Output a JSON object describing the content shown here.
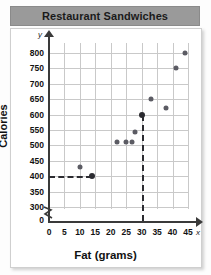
{
  "title": "Restaurant Sandwiches",
  "chart_data": {
    "type": "scatter",
    "title": "Restaurant Sandwiches",
    "xlabel": "Fat (grams)",
    "ylabel": "Calories",
    "xlim": [
      0,
      47
    ],
    "ylim": [
      280,
      820
    ],
    "grid": true,
    "legend": "none",
    "axis_letters": {
      "x": "x",
      "y": "y"
    },
    "y_axis_break": true,
    "xticks": [
      0,
      5,
      10,
      15,
      20,
      25,
      30,
      35,
      40,
      45
    ],
    "yticks": [
      0,
      300,
      350,
      400,
      450,
      500,
      550,
      600,
      650,
      700,
      750,
      800
    ],
    "x": [
      10,
      14,
      22,
      25,
      27,
      28,
      30,
      33,
      38,
      41,
      44
    ],
    "y": [
      430,
      400,
      510,
      510,
      510,
      545,
      600,
      650,
      620,
      750,
      800
    ],
    "points": [
      {
        "x": 10,
        "y": 430,
        "highlight": false
      },
      {
        "x": 14,
        "y": 400,
        "highlight": true
      },
      {
        "x": 22,
        "y": 510,
        "highlight": false
      },
      {
        "x": 25,
        "y": 510,
        "highlight": false
      },
      {
        "x": 27,
        "y": 510,
        "highlight": false
      },
      {
        "x": 28,
        "y": 545,
        "highlight": false
      },
      {
        "x": 30,
        "y": 600,
        "highlight": true
      },
      {
        "x": 33,
        "y": 650,
        "highlight": false
      },
      {
        "x": 38,
        "y": 620,
        "highlight": false
      },
      {
        "x": 41,
        "y": 750,
        "highlight": false
      },
      {
        "x": 44,
        "y": 800,
        "highlight": false
      }
    ],
    "annotations": [
      {
        "kind": "dashed-horizontal",
        "y": 400,
        "from_x": 0,
        "to_x": 14
      },
      {
        "kind": "dashed-vertical",
        "x": 30,
        "from_y": 280,
        "to_y": 600
      }
    ],
    "colors": {
      "point": "#5b5b63",
      "point_highlight": "#2b2b30",
      "grid": "#c9c9c9",
      "axis": "#3a3a3a",
      "title_banner": "#9a9a9a",
      "background": "#ffffff"
    }
  }
}
